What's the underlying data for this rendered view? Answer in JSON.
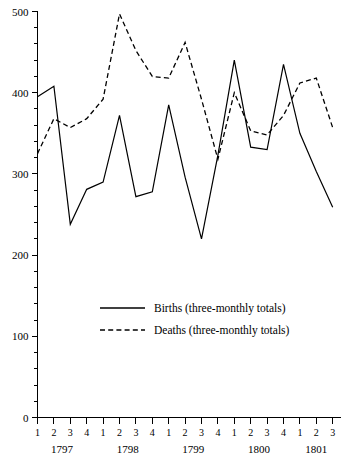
{
  "chart_data": {
    "type": "line",
    "title": "",
    "subtitle": "",
    "xlabel": "",
    "ylabel": "",
    "ylim": [
      0,
      500
    ],
    "y_major_ticks": [
      0,
      100,
      200,
      300,
      400,
      500
    ],
    "y_minor_tick_step": 20,
    "grid": false,
    "legend_position": "center",
    "x": [
      "1797 Q1",
      "1797 Q2",
      "1797 Q3",
      "1797 Q4",
      "1798 Q1",
      "1798 Q2",
      "1798 Q3",
      "1798 Q4",
      "1799 Q1",
      "1799 Q2",
      "1799 Q3",
      "1799 Q4",
      "1800 Q1",
      "1800 Q2",
      "1800 Q3",
      "1800 Q4",
      "1801 Q1",
      "1801 Q2",
      "1801 Q3"
    ],
    "quarter_labels": [
      "1",
      "2",
      "3",
      "4",
      "1",
      "2",
      "3",
      "4",
      "1",
      "2",
      "3",
      "4",
      "1",
      "2",
      "3",
      "4",
      "1",
      "2",
      "3"
    ],
    "year_groups": [
      {
        "label": "1797",
        "start_index": 0,
        "end_index": 3
      },
      {
        "label": "1798",
        "start_index": 4,
        "end_index": 7
      },
      {
        "label": "1799",
        "start_index": 8,
        "end_index": 11
      },
      {
        "label": "1800",
        "start_index": 12,
        "end_index": 15
      },
      {
        "label": "1801",
        "start_index": 16,
        "end_index": 18
      }
    ],
    "series": [
      {
        "name": "Births (three-monthly totals)",
        "style": "solid",
        "color": "#000000",
        "values": [
          395,
          408,
          238,
          281,
          290,
          372,
          272,
          278,
          385,
          296,
          220,
          323,
          440,
          333,
          330,
          435,
          350,
          303,
          259
        ]
      },
      {
        "name": "Deaths (three-monthly totals)",
        "style": "dashed",
        "color": "#000000",
        "values": [
          325,
          368,
          357,
          368,
          392,
          497,
          452,
          420,
          418,
          462,
          392,
          318,
          400,
          353,
          348,
          372,
          412,
          418,
          357
        ]
      }
    ]
  },
  "legend": {
    "entries": [
      {
        "label": "Births (three-monthly totals)",
        "style": "solid"
      },
      {
        "label": "Deaths (three-monthly totals)",
        "style": "dashed"
      }
    ]
  },
  "axes": {
    "y_tick_labels": [
      "500",
      "400",
      "300",
      "200",
      "100",
      "0"
    ],
    "x_quarter_labels": [
      "1",
      "2",
      "3",
      "4",
      "1",
      "2",
      "3",
      "4",
      "1",
      "2",
      "3",
      "4",
      "1",
      "2",
      "3",
      "4",
      "1",
      "2",
      "3"
    ],
    "x_year_labels": [
      "1797",
      "1798",
      "1799",
      "1800",
      "1801"
    ]
  }
}
